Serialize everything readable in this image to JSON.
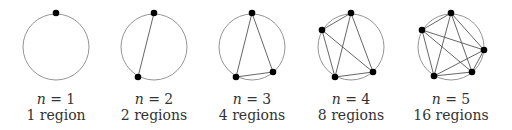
{
  "figure": {
    "panels": [
      {
        "n": "1",
        "label_n": "n = 1",
        "label_regions": "1 region",
        "center": [
          56,
          47
        ],
        "radius": 33,
        "points": [
          [
            56,
            13
          ]
        ]
      },
      {
        "n": "2",
        "label_n": "n = 2",
        "label_regions": "2 regions",
        "center": [
          154,
          47
        ],
        "radius": 33,
        "points": [
          [
            154,
            13
          ],
          [
            138,
            77
          ]
        ]
      },
      {
        "n": "3",
        "label_n": "n = 3",
        "label_regions": "4 regions",
        "center": [
          252,
          47
        ],
        "radius": 33,
        "points": [
          [
            252,
            13
          ],
          [
            236,
            77
          ],
          [
            273,
            72
          ]
        ]
      },
      {
        "n": "4",
        "label_n": "n = 4",
        "label_regions": "8 regions",
        "center": [
          351,
          47
        ],
        "radius": 33,
        "points": [
          [
            351,
            13
          ],
          [
            322,
            30
          ],
          [
            335,
            77
          ],
          [
            373,
            72
          ]
        ]
      },
      {
        "n": "5",
        "label_n": "n = 5",
        "label_regions": "16 regions",
        "center": [
          451,
          47
        ],
        "radius": 33,
        "points": [
          [
            451,
            13
          ],
          [
            422,
            30
          ],
          [
            484,
            50
          ],
          [
            434,
            76
          ],
          [
            472,
            72
          ]
        ]
      }
    ],
    "colors": {
      "circle": "#888888",
      "chord": "#555555",
      "point": "#000000",
      "text": "#333333"
    }
  }
}
